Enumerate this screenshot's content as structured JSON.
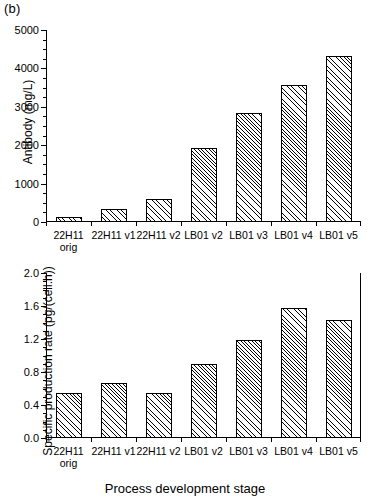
{
  "figure": {
    "panel_tag": "(b)",
    "xlabel": "Process development stage",
    "categories": [
      {
        "line1": "22H11",
        "line2": "orig"
      },
      {
        "line1": "22H11 v1",
        "line2": ""
      },
      {
        "line1": "22H11 v2",
        "line2": ""
      },
      {
        "line1": "LB01 v2",
        "line2": ""
      },
      {
        "line1": "LB01 v3",
        "line2": ""
      },
      {
        "line1": "LB01 v4",
        "line2": ""
      },
      {
        "line1": "LB01 v5",
        "line2": ""
      }
    ]
  },
  "chart_data": [
    {
      "id": "antibody",
      "type": "bar",
      "title": "",
      "xlabel": "",
      "ylabel": "Antibody (mg/L)",
      "categories": [
        "22H11 orig",
        "22H11 v1",
        "22H11 v2",
        "LB01 v2",
        "LB01 v3",
        "LB01 v4",
        "LB01 v5"
      ],
      "values": [
        140,
        330,
        590,
        1930,
        2830,
        3560,
        4330
      ],
      "ylim": [
        0,
        5000
      ],
      "yticks": [
        0,
        1000,
        2000,
        3000,
        4000,
        5000
      ],
      "ytick_labels": [
        "0",
        "1000",
        "2000",
        "3000",
        "4000",
        "5000"
      ],
      "minor_tick_interval": 250,
      "grid": false,
      "legend": "none",
      "bar_fill": "diagonal-hatch",
      "bar_edge_color": "#000000"
    },
    {
      "id": "specific-production-rate",
      "type": "bar",
      "title": "",
      "xlabel": "Process development stage",
      "ylabel": "Specific production rate (pg/(cell.h))",
      "categories": [
        "22H11 orig",
        "22H11 v1",
        "22H11 v2",
        "LB01 v2",
        "LB01 v3",
        "LB01 v4",
        "LB01 v5"
      ],
      "values": [
        0.54,
        0.67,
        0.55,
        0.9,
        1.19,
        1.57,
        1.43
      ],
      "ylim": [
        0.0,
        2.0
      ],
      "yticks": [
        0.0,
        0.4,
        0.8,
        1.2,
        1.6,
        2.0
      ],
      "ytick_labels": [
        "0.0",
        "0.4",
        "0.8",
        "1.2",
        "1.6",
        "2.0"
      ],
      "minor_tick_interval": 0.1,
      "grid": false,
      "legend": "none",
      "bar_fill": "diagonal-hatch",
      "bar_edge_color": "#000000"
    }
  ]
}
